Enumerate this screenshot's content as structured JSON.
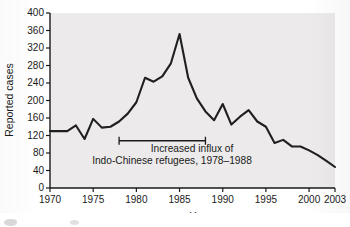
{
  "chart_data": {
    "type": "line",
    "title": "",
    "xlabel": "Year",
    "ylabel": "Reported cases",
    "xlim": [
      1970,
      2003
    ],
    "ylim": [
      0,
      400
    ],
    "grid": false,
    "legend": "none",
    "xticks": [
      1970,
      1975,
      1980,
      1985,
      1990,
      1995,
      2000,
      2003
    ],
    "xtick_labels": [
      "1970",
      "1975",
      "1980",
      "1985",
      "1990",
      "1995",
      "2000",
      "2003"
    ],
    "yticks": [
      0,
      40,
      80,
      120,
      160,
      200,
      240,
      280,
      320,
      360,
      400
    ],
    "ytick_labels": [
      "0",
      "40",
      "80",
      "120",
      "160",
      "200",
      "240",
      "280",
      "320",
      "360",
      "400"
    ],
    "series": [
      {
        "name": "Reported cases",
        "color": "#1f1f1f",
        "x": [
          1970,
          1971,
          1972,
          1973,
          1974,
          1975,
          1976,
          1977,
          1978,
          1979,
          1980,
          1981,
          1982,
          1983,
          1984,
          1985,
          1986,
          1987,
          1988,
          1989,
          1990,
          1991,
          1992,
          1993,
          1994,
          1995,
          1996,
          1997,
          1998,
          1999,
          2000,
          2001,
          2002,
          2003
        ],
        "values": [
          130,
          130,
          130,
          143,
          112,
          158,
          138,
          140,
          152,
          170,
          196,
          252,
          243,
          255,
          285,
          352,
          252,
          205,
          175,
          155,
          192,
          145,
          163,
          178,
          152,
          140,
          103,
          110,
          95,
          95,
          86,
          75,
          62,
          48
        ]
      }
    ],
    "annotations": [
      {
        "type": "bracket-label",
        "line1": "Increased influx of",
        "line2": "Indo-Chinese refugees, 1978–1988",
        "x_start": 1978,
        "x_end": 1988,
        "y": 108
      }
    ]
  },
  "colors": {
    "plot_background": "#eceaea",
    "line": "#1f1f1f",
    "axis": "#1a1a1a",
    "text": "#111111",
    "page_background": "#ffffff"
  }
}
